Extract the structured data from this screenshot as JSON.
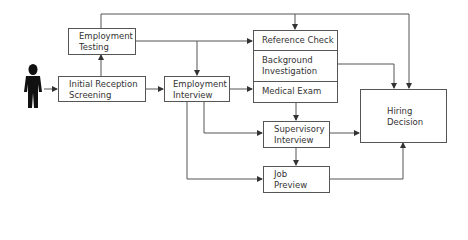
{
  "diagram": {
    "title": "",
    "nodes": {
      "applicant": {
        "icon": "person-icon"
      },
      "initial_reception": {
        "label": "Initial Reception\nScreening"
      },
      "employment_testing": {
        "label": "Employment\nTesting"
      },
      "employment_interview": {
        "label": "Employment\nInterview"
      },
      "reference_check": {
        "label": "Reference Check"
      },
      "background_investigation": {
        "label": "Background\nInvestigation"
      },
      "medical_exam": {
        "label": "Medical Exam"
      },
      "supervisory_interview": {
        "label": "Supervisory\nInterview"
      },
      "job_preview": {
        "label": "Job\nPreview"
      },
      "hiring_decision": {
        "label": "Hiring\nDecision"
      }
    },
    "edges": [
      [
        "applicant",
        "initial_reception"
      ],
      [
        "initial_reception",
        "employment_testing"
      ],
      [
        "initial_reception",
        "employment_interview"
      ],
      [
        "employment_testing",
        "reference_check"
      ],
      [
        "employment_testing",
        "employment_interview"
      ],
      [
        "employment_testing",
        "reference_check (top)"
      ],
      [
        "employment_testing",
        "hiring_decision"
      ],
      [
        "employment_interview",
        "medical_exam"
      ],
      [
        "employment_interview",
        "supervisory_interview"
      ],
      [
        "employment_interview",
        "job_preview"
      ],
      [
        "background_investigation",
        "hiring_decision"
      ],
      [
        "medical_exam",
        "supervisory_interview"
      ],
      [
        "supervisory_interview",
        "job_preview"
      ],
      [
        "supervisory_interview",
        "hiring_decision"
      ],
      [
        "job_preview",
        "hiring_decision"
      ]
    ],
    "colors": {
      "line": "#555555",
      "text": "#333333",
      "figure": "#111111"
    }
  }
}
